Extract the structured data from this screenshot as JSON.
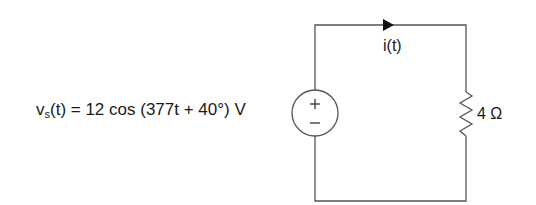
{
  "diagram": {
    "type": "circuit",
    "source": {
      "label_prefix": "v",
      "label_subscript": "s",
      "label_suffix": "(t) = 12 cos (377t + 40°) V",
      "amplitude": "12",
      "omega": "377",
      "phase": "40°",
      "unit": "V",
      "plus_symbol": "+",
      "minus_symbol": "−"
    },
    "current": {
      "label": "i(t)",
      "direction": "clockwise"
    },
    "resistor": {
      "label": "4 Ω",
      "value": "4",
      "unit": "Ω"
    },
    "colors": {
      "wire": "#555555",
      "text": "#1a1a1a"
    }
  }
}
